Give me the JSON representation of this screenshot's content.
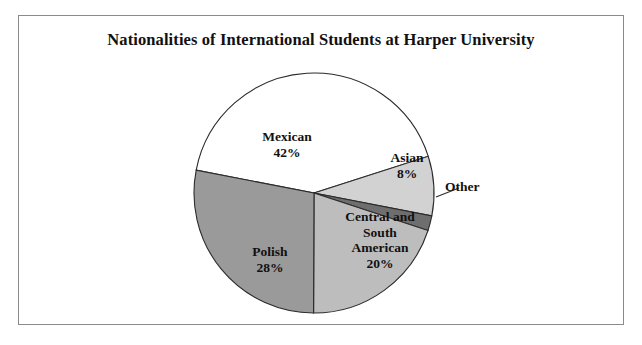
{
  "figure": {
    "title": "Nationalities of International Students at Harper University",
    "border_color": "#8a8a8a",
    "background": "#ffffff"
  },
  "chart_data": {
    "type": "pie",
    "title": "Nationalities of International Students at Harper University",
    "xlabel": "",
    "ylabel": "",
    "categories": [
      "Mexican",
      "Asian",
      "Other",
      "Central and South American",
      "Polish"
    ],
    "values": [
      42,
      8,
      2,
      20,
      28
    ],
    "unit": "%",
    "legend": "none",
    "grid": false,
    "colors": [
      "#ffffff",
      "#d2d2d2",
      "#6e6e6e",
      "#bdbdbd",
      "#9a9a9a"
    ],
    "slice_edge_color": "#2b2b2b",
    "start_angle_deg": 191,
    "direction": "clockwise",
    "slices": [
      {
        "label": "Mexican",
        "value": 42,
        "value_text": "42%",
        "color": "#ffffff",
        "label_inside": true
      },
      {
        "label": "Asian",
        "value": 8,
        "value_text": "8%",
        "color": "#d2d2d2",
        "label_inside": true
      },
      {
        "label": "Other",
        "value": 2,
        "value_text": "",
        "color": "#6e6e6e",
        "label_inside": false
      },
      {
        "label": "Central and South American",
        "value": 20,
        "value_text": "20%",
        "color": "#bdbdbd",
        "label_inside": true
      },
      {
        "label": "Polish",
        "value": 28,
        "value_text": "28%",
        "color": "#9a9a9a",
        "label_inside": true
      }
    ]
  },
  "labels": {
    "mexican": "Mexican\n42%",
    "asian": "Asian\n8%",
    "other": "Other",
    "central_south_american": "Central and\nSouth\nAmerican\n20%",
    "polish": "Polish\n28%"
  }
}
